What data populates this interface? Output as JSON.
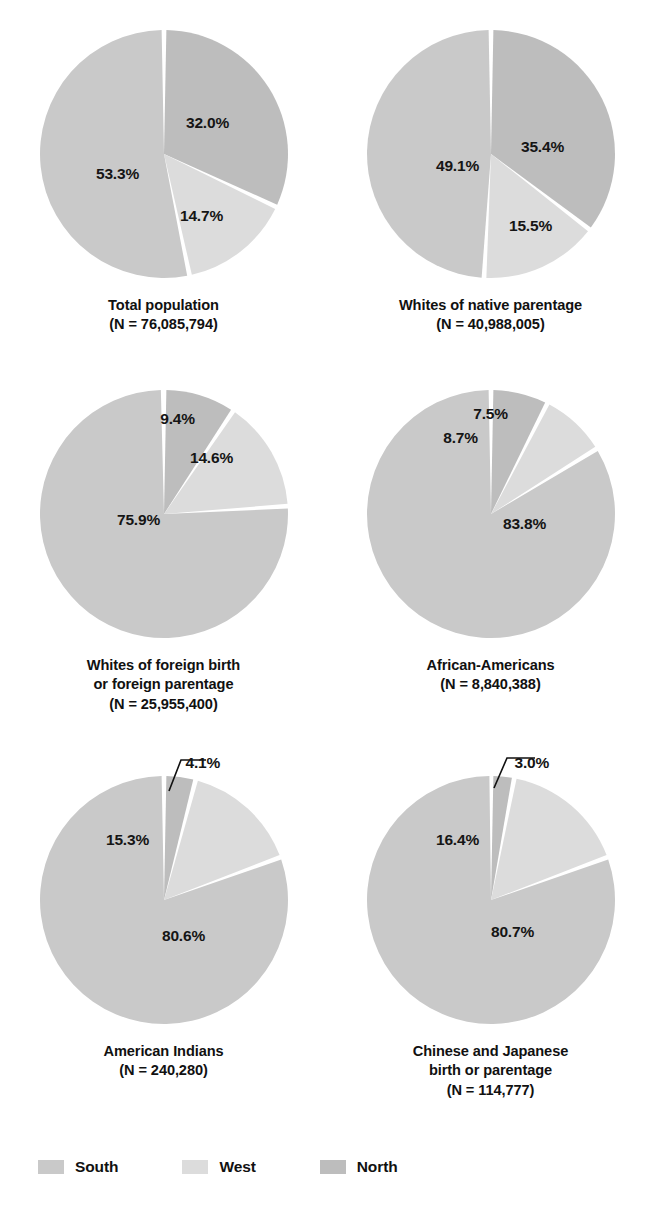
{
  "chart_data": {
    "type": "pie",
    "title": "",
    "legend_position": "bottom-left",
    "legend": [
      {
        "name": "South",
        "color": "#c9c9c9"
      },
      {
        "name": "West",
        "color": "#dcdcdc"
      },
      {
        "name": "North",
        "color": "#bdbdbd"
      }
    ],
    "slice_order_clockwise_from_12": [
      "North",
      "West",
      "South"
    ],
    "charts": [
      {
        "id": "total-population",
        "caption_line1": "Total population",
        "caption_line2": "(N = 76,085,794)",
        "n": "76,085,794",
        "categories": [
          "North",
          "West",
          "South"
        ],
        "values": [
          32.0,
          14.7,
          53.3
        ],
        "labels": [
          "32.0%",
          "14.7%",
          "53.3%"
        ],
        "label_positions": [
          {
            "key": "north",
            "x": 172,
            "y": 97
          },
          {
            "key": "west",
            "x": 166,
            "y": 190
          },
          {
            "key": "south",
            "x": 82,
            "y": 148
          }
        ],
        "leader": null
      },
      {
        "id": "whites-native-parentage",
        "caption_line1": "Whites of native parentage",
        "caption_line2": "(N = 40,988,005)",
        "n": "40,988,005",
        "categories": [
          "North",
          "West",
          "South"
        ],
        "values": [
          35.4,
          15.5,
          49.1
        ],
        "labels": [
          "35.4%",
          "15.5%",
          "49.1%"
        ],
        "label_positions": [
          {
            "key": "north",
            "x": 180,
            "y": 121
          },
          {
            "key": "west",
            "x": 168,
            "y": 200
          },
          {
            "key": "south",
            "x": 95,
            "y": 140
          }
        ],
        "leader": null
      },
      {
        "id": "whites-foreign-birth-or-parentage",
        "caption_line1": "Whites of foreign birth",
        "caption_line2": "or foreign parentage",
        "caption_line3": "(N = 25,955,400)",
        "n": "25,955,400",
        "categories": [
          "North",
          "West",
          "South"
        ],
        "values": [
          9.4,
          14.6,
          75.9
        ],
        "labels": [
          "9.4%",
          "14.6%",
          "75.9%"
        ],
        "label_positions": [
          {
            "key": "north",
            "x": 142,
            "y": 33
          },
          {
            "key": "west",
            "x": 176,
            "y": 72
          },
          {
            "key": "south",
            "x": 103,
            "y": 134
          }
        ],
        "leader": null
      },
      {
        "id": "african-americans",
        "caption_line1": "African-Americans",
        "caption_line2": "(N = 8,840,388)",
        "n": "8,840,388",
        "categories": [
          "North",
          "West",
          "South"
        ],
        "values": [
          7.5,
          8.7,
          83.8
        ],
        "labels": [
          "7.5%",
          "8.7%",
          "83.8%"
        ],
        "label_positions": [
          {
            "key": "north",
            "x": 128,
            "y": 28
          },
          {
            "key": "west",
            "x": 98,
            "y": 52
          },
          {
            "key": "south",
            "x": 162,
            "y": 138
          }
        ],
        "leader": null
      },
      {
        "id": "american-indians",
        "caption_line1": "American Indians",
        "caption_line2": "(N = 240,280)",
        "n": "240,280",
        "categories": [
          "North",
          "West",
          "South"
        ],
        "values": [
          4.1,
          15.3,
          80.6
        ],
        "labels": [
          "4.1%",
          "15.3%",
          "80.6%"
        ],
        "label_positions": [
          {
            "key": "west",
            "x": 92,
            "y": 68
          },
          {
            "key": "south",
            "x": 148,
            "y": 164
          }
        ],
        "leader": {
          "label": "4.1%",
          "label_x": 150,
          "label_y": -18,
          "path": "M 133 45 L 145 14 L 170 14"
        }
      },
      {
        "id": "chinese-and-japanese",
        "caption_line1": "Chinese and Japanese",
        "caption_line2": "birth or parentage",
        "caption_line3": "(N = 114,777)",
        "n": "114,777",
        "categories": [
          "North",
          "West",
          "South"
        ],
        "values": [
          3.0,
          16.4,
          80.7
        ],
        "labels": [
          "3.0%",
          "16.4%",
          "80.7%"
        ],
        "label_positions": [
          {
            "key": "west",
            "x": 95,
            "y": 68
          },
          {
            "key": "south",
            "x": 150,
            "y": 160
          }
        ],
        "leader": {
          "label": "3.0%",
          "label_x": 152,
          "label_y": -18,
          "path": "M 131 42 L 144 12 L 172 12"
        }
      }
    ]
  }
}
